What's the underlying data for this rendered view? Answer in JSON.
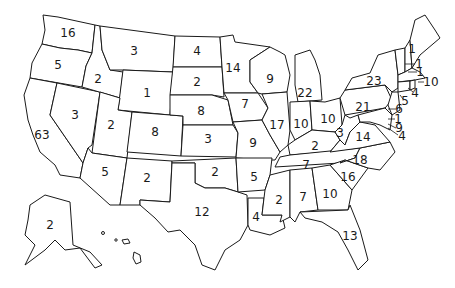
{
  "map": {
    "type": "us-states-choropleth-outline",
    "states": [
      {
        "state": "WA",
        "value": "16",
        "x": 68,
        "y": 33
      },
      {
        "state": "OR",
        "value": "5",
        "x": 58,
        "y": 65
      },
      {
        "state": "CA",
        "value": "63",
        "x": 42,
        "y": 135
      },
      {
        "state": "NV",
        "value": "3",
        "x": 75,
        "y": 115
      },
      {
        "state": "ID",
        "value": "2",
        "x": 98,
        "y": 79
      },
      {
        "state": "MT",
        "value": "3",
        "x": 134,
        "y": 51
      },
      {
        "state": "WY",
        "value": "1",
        "x": 147,
        "y": 93
      },
      {
        "state": "UT",
        "value": "2",
        "x": 111,
        "y": 125
      },
      {
        "state": "CO",
        "value": "8",
        "x": 155,
        "y": 132
      },
      {
        "state": "AZ",
        "value": "5",
        "x": 105,
        "y": 172
      },
      {
        "state": "NM",
        "value": "2",
        "x": 147,
        "y": 178
      },
      {
        "state": "ND",
        "value": "4",
        "x": 197,
        "y": 51
      },
      {
        "state": "SD",
        "value": "2",
        "x": 197,
        "y": 82
      },
      {
        "state": "NE",
        "value": "8",
        "x": 201,
        "y": 111
      },
      {
        "state": "KS",
        "value": "3",
        "x": 208,
        "y": 139
      },
      {
        "state": "OK",
        "value": "2",
        "x": 215,
        "y": 172
      },
      {
        "state": "TX",
        "value": "12",
        "x": 202,
        "y": 212
      },
      {
        "state": "MN",
        "value": "14",
        "x": 233,
        "y": 68
      },
      {
        "state": "IA",
        "value": "7",
        "x": 245,
        "y": 104
      },
      {
        "state": "MO",
        "value": "9",
        "x": 253,
        "y": 143
      },
      {
        "state": "AR",
        "value": "5",
        "x": 254,
        "y": 177
      },
      {
        "state": "LA",
        "value": "4",
        "x": 256,
        "y": 217
      },
      {
        "state": "WI",
        "value": "9",
        "x": 270,
        "y": 79
      },
      {
        "state": "IL",
        "value": "17",
        "x": 277,
        "y": 125
      },
      {
        "state": "MI",
        "value": "22",
        "x": 305,
        "y": 93
      },
      {
        "state": "IN",
        "value": "10",
        "x": 301,
        "y": 124
      },
      {
        "state": "OH",
        "value": "10",
        "x": 328,
        "y": 119
      },
      {
        "state": "KY",
        "value": "2",
        "x": 315,
        "y": 146
      },
      {
        "state": "TN",
        "value": "7",
        "x": 306,
        "y": 165
      },
      {
        "state": "MS",
        "value": "2",
        "x": 279,
        "y": 200
      },
      {
        "state": "AL",
        "value": "7",
        "x": 303,
        "y": 197
      },
      {
        "state": "GA",
        "value": "10",
        "x": 330,
        "y": 194
      },
      {
        "state": "FL",
        "value": "13",
        "x": 350,
        "y": 236
      },
      {
        "state": "SC",
        "value": "16",
        "x": 348,
        "y": 177
      },
      {
        "state": "NC",
        "value": "18",
        "x": 360,
        "y": 160
      },
      {
        "state": "WV",
        "value": "3",
        "x": 340,
        "y": 133
      },
      {
        "state": "VA",
        "value": "14",
        "x": 363,
        "y": 137
      },
      {
        "state": "PA",
        "value": "21",
        "x": 363,
        "y": 107
      },
      {
        "state": "NY",
        "value": "23",
        "x": 374,
        "y": 81
      },
      {
        "state": "ME",
        "value": "1",
        "x": 412,
        "y": 49
      },
      {
        "state": "NH",
        "value": "1",
        "x": 419,
        "y": 64
      },
      {
        "state": "VT",
        "value": "1",
        "x": 420,
        "y": 72
      },
      {
        "state": "MA",
        "value": "10",
        "x": 429,
        "y": 82
      },
      {
        "state": "RI",
        "value": "4",
        "x": 415,
        "y": 92
      },
      {
        "state": "CT",
        "value": "5",
        "x": 405,
        "y": 100
      },
      {
        "state": "NJ",
        "value": "6",
        "x": 399,
        "y": 109
      },
      {
        "state": "DE",
        "value": "1",
        "x": 398,
        "y": 119
      },
      {
        "state": "MD",
        "value": "9",
        "x": 399,
        "y": 128
      },
      {
        "state": "DC",
        "value": "4",
        "x": 402,
        "y": 136
      },
      {
        "state": "AK",
        "value": "2",
        "x": 50,
        "y": 225
      }
    ]
  }
}
